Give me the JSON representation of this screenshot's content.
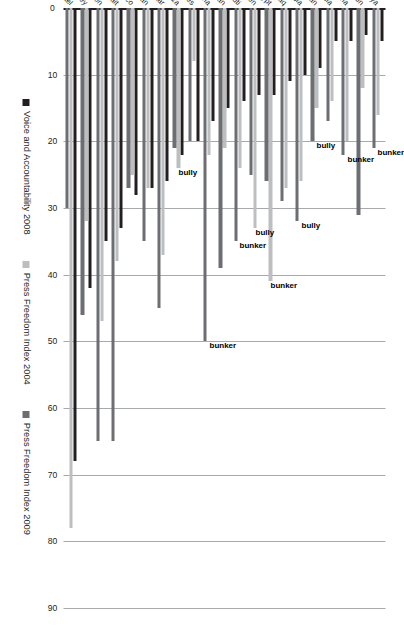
{
  "chart_data": {
    "type": "bar",
    "orientation": "horizontal",
    "title": "",
    "xlabel": "",
    "ylabel": "",
    "xlim": [
      0,
      90
    ],
    "ticks": [
      0,
      10,
      20,
      30,
      40,
      50,
      60,
      70,
      80,
      90
    ],
    "grid": true,
    "legend_position": "bottom",
    "categories": [
      "Israel",
      "Turkey",
      "Lebanon",
      "Kuwait",
      "Morocco",
      "Jordan",
      "Qatar",
      "West Bank & Gaza",
      "United Arab Emirates",
      "Algeria",
      "Oman",
      "Djibouti",
      "Yemen",
      "Egypt",
      "Iraq",
      "Tunisia",
      "Iran",
      "Saudi Arabia",
      "Syria",
      "Bahrain",
      "Libya"
    ],
    "series": [
      {
        "name": "Voice and Accountability 2008",
        "color": "#231f20",
        "values": [
          68,
          42,
          35,
          33,
          28,
          27,
          26,
          22,
          20,
          17,
          15,
          14,
          13,
          13,
          11,
          10,
          9,
          5,
          5,
          4,
          5
        ]
      },
      {
        "name": "Press Freedom Index 2004",
        "color": "#bcbec0",
        "values": [
          78,
          32,
          47,
          38,
          25,
          27,
          37,
          24,
          8,
          22,
          21,
          24,
          33,
          41,
          27,
          26,
          15,
          14,
          20,
          12,
          16
        ]
      },
      {
        "name": "Press Freedom Index 2009",
        "color": "#6d6e71",
        "values": [
          30,
          46,
          65,
          65,
          27,
          35,
          45,
          21,
          20,
          50,
          39,
          35,
          25,
          26,
          29,
          32,
          20,
          17,
          22,
          31,
          21
        ]
      }
    ],
    "annotations": [
      {
        "text": "bully",
        "category": "West Bank & Gaza"
      },
      {
        "text": "bunker",
        "category": "Algeria"
      },
      {
        "text": "bunker",
        "category": "Djibouti"
      },
      {
        "text": "bully",
        "category": "Yemen"
      },
      {
        "text": "bunker",
        "category": "Egypt"
      },
      {
        "text": "bully",
        "category": "Tunisia"
      },
      {
        "text": "bully",
        "category": "Iran"
      },
      {
        "text": "bunker",
        "category": "Syria"
      },
      {
        "text": "bunker",
        "category": "Libya"
      }
    ]
  },
  "legend": {
    "items": [
      {
        "label": "Voice and Accountability 2008",
        "color": "#231f20"
      },
      {
        "label": "Press Freedom Index 2004",
        "color": "#bcbec0"
      },
      {
        "label": "Press Freedom Index 2009",
        "color": "#6d6e71"
      }
    ]
  }
}
